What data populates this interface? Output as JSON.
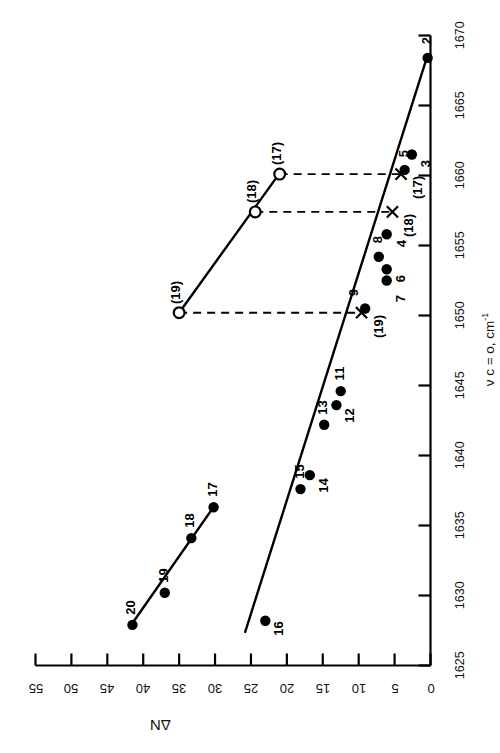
{
  "chart_data": {
    "type": "scatter",
    "title": "",
    "xlabel": "ν c = o, cm⁻¹",
    "ylabel": "ΔN",
    "orientation": "rotated-90",
    "xlim": [
      1625,
      1670
    ],
    "ylim": [
      0,
      55
    ],
    "xticks": [
      1625,
      1630,
      1635,
      1640,
      1645,
      1650,
      1655,
      1660,
      1665,
      1670
    ],
    "yticks": [
      0,
      5,
      10,
      15,
      20,
      25,
      30,
      35,
      40,
      45,
      50,
      55
    ],
    "xtick_labels": [
      "1625",
      "1630",
      "1635",
      "1640",
      "1645",
      "1650",
      "1655",
      "1660",
      "1665",
      "1670"
    ],
    "ytick_labels": [
      "0",
      "5",
      "10",
      "15",
      "20",
      "25",
      "30",
      "35",
      "40",
      "45",
      "50",
      "55"
    ],
    "grid": false,
    "legend": "none",
    "series": [
      {
        "name": "lower-line-filled",
        "marker": "filled-circle",
        "fit_line": {
          "x": [
            1627.4,
            1668.6
          ],
          "y": [
            25.8,
            0.4
          ]
        },
        "points": [
          {
            "label": "2",
            "x": 1668.4,
            "y": 0.4
          },
          {
            "label": "3",
            "x": 1661.5,
            "y": 2.6
          },
          {
            "label": "5",
            "x": 1660.4,
            "y": 3.6
          },
          {
            "label": "4",
            "x": 1655.8,
            "y": 6.1
          },
          {
            "label": "8",
            "x": 1654.2,
            "y": 7.2
          },
          {
            "label": "6",
            "x": 1653.3,
            "y": 6.1
          },
          {
            "label": "7",
            "x": 1652.5,
            "y": 6.1
          },
          {
            "label": "9",
            "x": 1650.5,
            "y": 9.1
          },
          {
            "label": "11",
            "x": 1644.6,
            "y": 12.5
          },
          {
            "label": "12",
            "x": 1643.6,
            "y": 13.1
          },
          {
            "label": "13",
            "x": 1642.2,
            "y": 14.8
          },
          {
            "label": "14",
            "x": 1638.6,
            "y": 16.8
          },
          {
            "label": "15",
            "x": 1637.6,
            "y": 18.1
          },
          {
            "label": "16",
            "x": 1628.2,
            "y": 23.0
          }
        ]
      },
      {
        "name": "upper-line-filled",
        "marker": "filled-circle",
        "fit_line": {
          "x": [
            1627.8,
            1636.4
          ],
          "y": [
            41.8,
            30.1
          ]
        },
        "points": [
          {
            "label": "20",
            "x": 1627.9,
            "y": 41.5
          },
          {
            "label": "19",
            "x": 1630.2,
            "y": 37.0
          },
          {
            "label": "18",
            "x": 1634.1,
            "y": 33.3
          },
          {
            "label": "17",
            "x": 1636.3,
            "y": 30.2
          }
        ]
      },
      {
        "name": "open-circle-line",
        "marker": "open-circle",
        "fit_line": {
          "x": [
            1650.2,
            1660.1
          ],
          "y": [
            35.0,
            21.1
          ]
        },
        "points": [
          {
            "label": "(19)",
            "x": 1650.2,
            "y": 35.0
          },
          {
            "label": "(18)",
            "x": 1657.4,
            "y": 24.4
          },
          {
            "label": "(17)",
            "x": 1660.1,
            "y": 21.0
          }
        ]
      },
      {
        "name": "projection-crosses",
        "marker": "x-cross",
        "points": [
          {
            "label": "(19)",
            "x": 1650.2,
            "y": 9.6
          },
          {
            "label": "(18)",
            "x": 1657.4,
            "y": 5.3
          },
          {
            "label": "(17)",
            "x": 1660.1,
            "y": 4.1
          }
        ]
      }
    ],
    "connectors": [
      {
        "from": {
          "x": 1650.2,
          "y": 35.0
        },
        "to": {
          "x": 1650.2,
          "y": 9.6
        },
        "style": "dashed"
      },
      {
        "from": {
          "x": 1657.4,
          "y": 24.4
        },
        "to": {
          "x": 1657.4,
          "y": 5.3
        },
        "style": "dashed"
      },
      {
        "from": {
          "x": 1660.1,
          "y": 21.0
        },
        "to": {
          "x": 1660.1,
          "y": 4.1
        },
        "style": "dashed"
      }
    ],
    "annotations": []
  },
  "colors": {
    "ink": "#000000",
    "background": "#ffffff"
  }
}
